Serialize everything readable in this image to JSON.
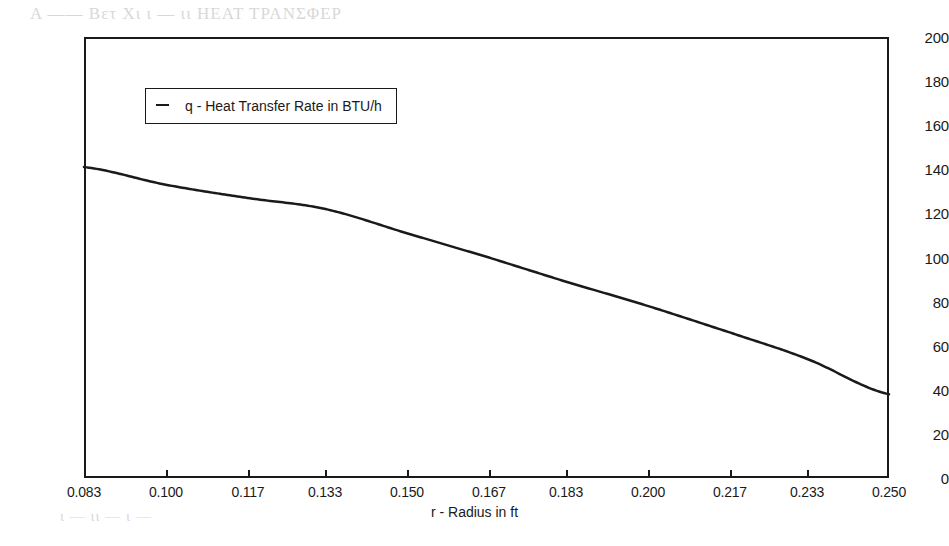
{
  "chart_data": {
    "type": "line",
    "title": "",
    "subtitle": "",
    "xlabel": "r - Radius in ft",
    "ylabel": "",
    "xlim": [
      0.083,
      0.25
    ],
    "ylim": [
      0,
      200
    ],
    "grid": false,
    "legend_position": "inside-upper-left",
    "x_tick_labels": [
      "0.083",
      "0.100",
      "0.117",
      "0.133",
      "0.150",
      "0.167",
      "0.183",
      "0.200",
      "0.217",
      "0.233",
      "0.250"
    ],
    "y_tick_labels": [
      "0",
      "20",
      "40",
      "60",
      "80",
      "100",
      "120",
      "140",
      "160",
      "180",
      "200"
    ],
    "x": [
      0.083,
      0.1,
      0.117,
      0.133,
      0.15,
      0.167,
      0.183,
      0.2,
      0.217,
      0.233,
      0.25
    ],
    "series": [
      {
        "name": "q - Heat Transfer Rate in BTU/h",
        "values": [
          141,
          133,
          127,
          122,
          111,
          100,
          89,
          78,
          66,
          54,
          38
        ],
        "color": "#1a1a1a",
        "marker": "none",
        "linewidth": 2.5
      }
    ],
    "annotations": []
  },
  "legend": {
    "entries": [
      {
        "label": "q - Heat Transfer Rate in BTU/h"
      }
    ]
  },
  "axes": {
    "x_title": "r - Radius in ft",
    "y_ticks": [
      "200",
      "180",
      "160",
      "140",
      "120",
      "100",
      "80",
      "60",
      "40",
      "20",
      "0"
    ],
    "x_ticks": [
      "0.083",
      "0.100",
      "0.117",
      "0.133",
      "0.150",
      "0.167",
      "0.183",
      "0.200",
      "0.217",
      "0.233",
      "0.250"
    ]
  },
  "artifacts": {
    "bleed_1": "Α —— Βετ Χι ι — ιι ΗΕΑΤ ΤΡΑΝΣΦΕΡ",
    "bleed_2": "— ι — ιιι — ι",
    "bleed_3": "—— ι — ιι —",
    "bleed_4": "ι — ιι — ι —"
  }
}
